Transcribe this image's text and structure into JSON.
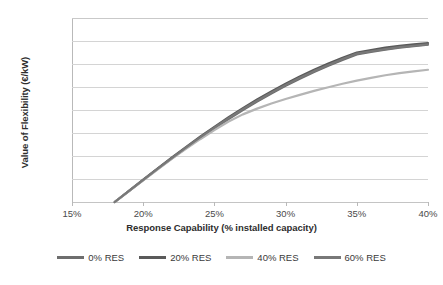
{
  "chart_data": {
    "type": "line",
    "title": "",
    "xlabel": "Response Capability (% installed capacity)",
    "ylabel": "Value of Flexibility (€/kW)",
    "xlim": [
      15,
      40
    ],
    "ylim": [
      0,
      1600
    ],
    "xticks": [
      "15%",
      "20%",
      "25%",
      "30%",
      "35%",
      "40%"
    ],
    "xtick_values": [
      15,
      20,
      25,
      30,
      35,
      40
    ],
    "yticks": [
      "0",
      "200",
      "400",
      "600",
      "800",
      "1,000",
      "1,200",
      "1,400",
      "1,600"
    ],
    "ytick_values": [
      0,
      200,
      400,
      600,
      800,
      1000,
      1200,
      1400,
      1600
    ],
    "grid": true,
    "legend_position": "bottom",
    "x": [
      18,
      19,
      20,
      21,
      22,
      23,
      24,
      25,
      26,
      27,
      28,
      29,
      30,
      31,
      32,
      33,
      34,
      35,
      36,
      37,
      38,
      39,
      40
    ],
    "series": [
      {
        "name": "0% RES",
        "color": "#6e6e6e",
        "values": [
          0,
          95,
          190,
          285,
          378,
          468,
          556,
          640,
          722,
          800,
          874,
          944,
          1010,
          1072,
          1130,
          1185,
          1236,
          1283,
          1305,
          1325,
          1342,
          1356,
          1368
        ]
      },
      {
        "name": "20% RES",
        "color": "#5a5a5a",
        "values": [
          0,
          97,
          194,
          291,
          386,
          478,
          568,
          654,
          737,
          816,
          891,
          962,
          1029,
          1092,
          1150,
          1204,
          1254,
          1300,
          1322,
          1342,
          1358,
          1371,
          1382
        ]
      },
      {
        "name": "40% RES",
        "color": "#b5b5b5",
        "values": [
          0,
          94,
          188,
          282,
          374,
          462,
          546,
          626,
          700,
          762,
          812,
          856,
          896,
          932,
          966,
          998,
          1028,
          1056,
          1080,
          1102,
          1120,
          1136,
          1150
        ]
      },
      {
        "name": "60% RES",
        "color": "#787878",
        "values": [
          0,
          96,
          192,
          288,
          382,
          473,
          562,
          647,
          729,
          807,
          881,
          951,
          1017,
          1080,
          1138,
          1192,
          1243,
          1290,
          1311,
          1330,
          1346,
          1359,
          1370
        ]
      }
    ]
  },
  "legend": {
    "items": [
      {
        "label": "0% RES",
        "color": "#6e6e6e"
      },
      {
        "label": "20% RES",
        "color": "#5a5a5a"
      },
      {
        "label": "40% RES",
        "color": "#b5b5b5"
      },
      {
        "label": "60% RES",
        "color": "#787878"
      }
    ]
  },
  "caption": {
    "text": ""
  }
}
